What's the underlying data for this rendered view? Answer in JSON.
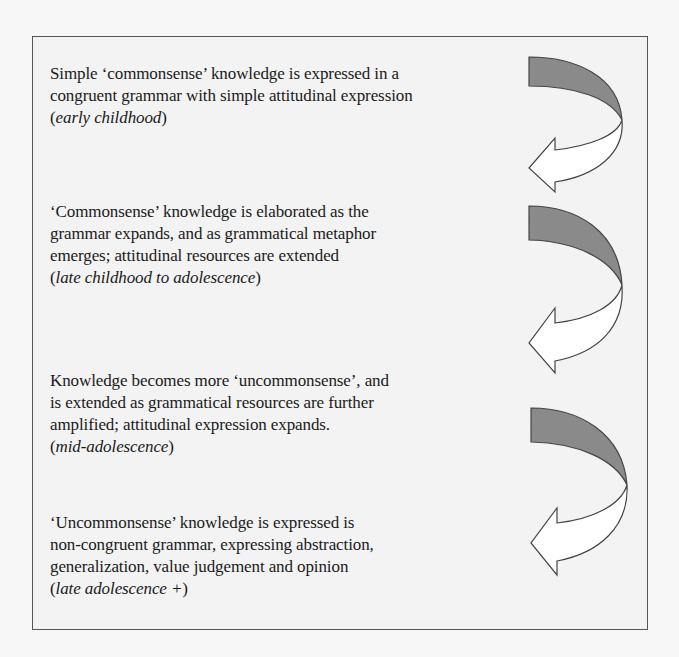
{
  "figure": {
    "type": "developmental-stages-flow",
    "stages": [
      {
        "lines": [
          "Simple ‘commonsense’ knowledge is expressed in a",
          "congruent grammar with simple attitudinal expression"
        ],
        "period": "early childhood"
      },
      {
        "lines": [
          "‘Commonsense’ knowledge is elaborated as the",
          "grammar expands, and as grammatical metaphor",
          "emerges; attitudinal resources are extended"
        ],
        "period": "late childhood to adolescence"
      },
      {
        "lines": [
          "Knowledge becomes more ‘uncommonsense’, and",
          "is extended as grammatical resources are further",
          "amplified; attitudinal expression expands."
        ],
        "period": "mid-adolescence"
      },
      {
        "lines": [
          "‘Uncommonsense’ knowledge is expressed is",
          "non-congruent grammar, expressing abstraction,",
          "generalization, value judgement and opinion"
        ],
        "period": "late adolescence +"
      }
    ],
    "arrows": [
      {
        "icon": "curved-arrow-down-left-icon"
      },
      {
        "icon": "curved-arrow-down-left-icon"
      },
      {
        "icon": "curved-arrow-down-left-icon"
      }
    ],
    "colors": {
      "arrow_band": "#8a8a8a",
      "arrow_outline": "#444444",
      "arrow_lower": "#ffffff",
      "frame_border": "#555555",
      "background": "#f3f3f3"
    }
  }
}
